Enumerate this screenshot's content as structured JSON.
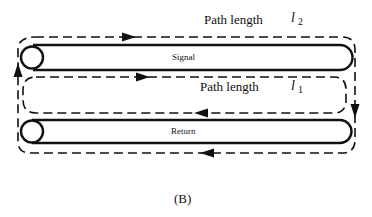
{
  "figure": {
    "caption": "(B)"
  },
  "conductors": {
    "signal": {
      "label": "Signal"
    },
    "return": {
      "label": "Return"
    }
  },
  "paths": {
    "outer": {
      "label": "Path length",
      "variable": "l",
      "subscript": "2"
    },
    "inner": {
      "label": "Path length",
      "variable": "l",
      "subscript": "1"
    }
  },
  "colors": {
    "line": "#111111",
    "background": "#ffffff"
  }
}
